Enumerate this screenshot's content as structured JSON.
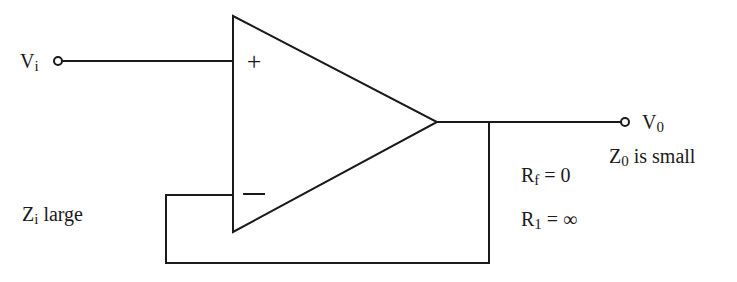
{
  "diagram": {
    "labels": {
      "input": {
        "main": "V",
        "sub": "i"
      },
      "output": {
        "main": "V",
        "sub": "0"
      },
      "plus": "+",
      "minus": "−",
      "input_impedance": {
        "main": "Z",
        "sub": "i",
        "rest": " large"
      },
      "output_impedance": {
        "main": "Z",
        "sub": "0",
        "rest": " is small"
      },
      "feedback_resistor": {
        "main": "R",
        "sub": "f",
        "rest": " = 0"
      },
      "load_resistor": {
        "main": "R",
        "sub": "1",
        "rest": " = ∞"
      }
    },
    "colors": {
      "line": "#1a1a1a",
      "background": "#ffffff"
    }
  }
}
